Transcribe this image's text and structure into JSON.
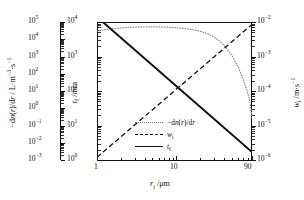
{
  "chart_data": {
    "type": "line",
    "title": "",
    "xlabel": "r_i /μm",
    "xscale": "log",
    "xlim": [
      1,
      90
    ],
    "xticks": [
      1,
      10,
      90
    ],
    "xticklabels": [
      "1",
      "10",
      "90"
    ],
    "grid": false,
    "legend_position": "center",
    "axes": [
      {
        "id": "outer-left",
        "label": "−dn(r)/dr / L·m⁻³·s⁻¹",
        "scale": "log",
        "lim": [
          0.001,
          100000
        ],
        "ticklabels": [
          "10⁵",
          "10⁴",
          "10³",
          "10²",
          "10¹",
          "10⁰",
          "10⁻¹",
          "10⁻²",
          "10⁻³"
        ]
      },
      {
        "id": "inner-left",
        "label": "t_f /min",
        "scale": "log",
        "lim": [
          1,
          10000
        ],
        "ticklabels": [
          "10⁴",
          "10³",
          "10²",
          "10¹",
          "10⁰"
        ]
      },
      {
        "id": "right",
        "label": "w_i /m·s⁻¹",
        "scale": "log",
        "lim": [
          1e-06,
          0.01
        ],
        "ticklabels": [
          "10⁻²",
          "10⁻³",
          "10⁻⁴",
          "10⁻⁵",
          "10⁻⁶"
        ]
      }
    ],
    "series": [
      {
        "name": "-dn(r)/dr",
        "style": "dotted",
        "color": "#8c8c8c",
        "axis": "outer-left",
        "x": [
          1,
          1.6,
          2.6,
          4.2,
          6.5,
          10,
          14,
          19,
          25,
          32,
          40,
          50,
          60,
          70,
          78,
          84,
          88,
          90
        ],
        "y": [
          30000,
          42000,
          50000,
          53000,
          52000,
          47000,
          40000,
          31000,
          21000,
          11000,
          4500,
          1200,
          260,
          45,
          10,
          3,
          0.7,
          0.25
        ]
      },
      {
        "name": "w_i",
        "style": "dashed",
        "color": "#111111",
        "axis": "right",
        "x": [
          1,
          90
        ],
        "y": [
          1.2e-06,
          0.0085
        ]
      },
      {
        "name": "t_f",
        "style": "solid",
        "color": "#111111",
        "axis": "inner-left",
        "x": [
          1,
          90
        ],
        "y": [
          14000,
          1.7
        ]
      }
    ],
    "legend": [
      {
        "label": "−dn(r)/dr",
        "style": "dotted"
      },
      {
        "label": "w_i",
        "style": "dashed"
      },
      {
        "label": "t_f",
        "style": "solid"
      }
    ]
  },
  "outer_left_axis": {
    "label_prefix": "−d",
    "label_n": "n",
    "label_mid": "(",
    "label_r": "r",
    "label_slash": ")/d",
    "label_r2": "r",
    "label_units": " / L·m",
    "label_sup1": "−3",
    "label_dot": "·s",
    "label_sup2": "−1",
    "ticks": [
      {
        "base": "10",
        "exp": "5"
      },
      {
        "base": "10",
        "exp": "4"
      },
      {
        "base": "10",
        "exp": "3"
      },
      {
        "base": "10",
        "exp": "2"
      },
      {
        "base": "10",
        "exp": "1"
      },
      {
        "base": "10",
        "exp": "0"
      },
      {
        "base": "10",
        "exp": "−1"
      },
      {
        "base": "10",
        "exp": "−2"
      },
      {
        "base": "10",
        "exp": "−3"
      }
    ]
  },
  "inner_left_axis": {
    "label_t": "t",
    "label_sub": "f",
    "label_units": " /min",
    "ticks": [
      {
        "base": "10",
        "exp": "4"
      },
      {
        "base": "10",
        "exp": "3"
      },
      {
        "base": "10",
        "exp": "2"
      },
      {
        "base": "10",
        "exp": "1"
      },
      {
        "base": "10",
        "exp": "0"
      }
    ]
  },
  "right_axis": {
    "label_w": "w",
    "label_sub": "i",
    "label_units": " /m·s",
    "label_sup": "−1",
    "ticks": [
      {
        "base": "10",
        "exp": "−2"
      },
      {
        "base": "10",
        "exp": "−3"
      },
      {
        "base": "10",
        "exp": "−4"
      },
      {
        "base": "10",
        "exp": "−5"
      },
      {
        "base": "10",
        "exp": "−6"
      }
    ]
  },
  "x_axis": {
    "label_r": "r",
    "label_sub": "i",
    "label_units": " /μm",
    "tick_1": "1",
    "tick_10": "10",
    "tick_90": "90"
  },
  "legend": {
    "item0_prefix": "−d",
    "item0_n": "n",
    "item0_open": "(",
    "item0_r": "r",
    "item0_close": ")/d",
    "item0_r2": "r",
    "item1_w": "w",
    "item1_sub": "i",
    "item2_t": "t",
    "item2_sub": "f"
  }
}
